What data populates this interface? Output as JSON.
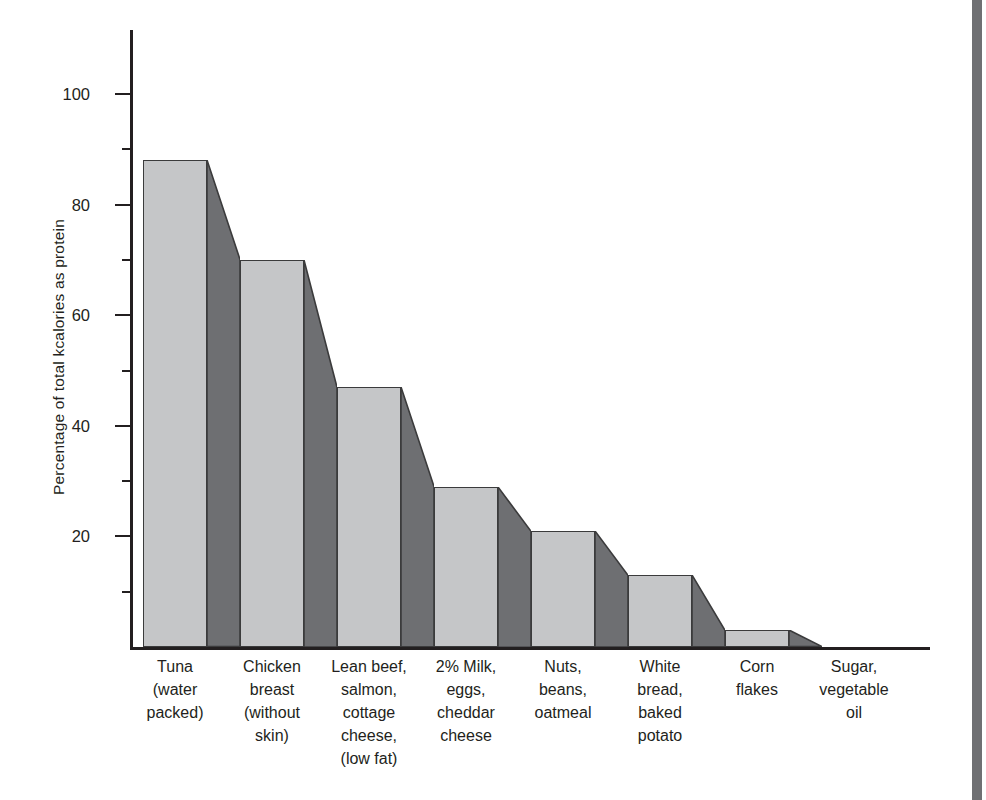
{
  "chart_data": {
    "type": "bar",
    "title": "",
    "xlabel": "",
    "ylabel": "Percentage of total kcalories as protein",
    "ylim": [
      0,
      110
    ],
    "grid": false,
    "legend": "none",
    "y_ticks_major": [
      20,
      40,
      60,
      80,
      100
    ],
    "y_tick_labels": [
      "20",
      "40",
      "60",
      "80",
      "100"
    ],
    "y_ticks_minor": [
      10,
      30,
      50,
      70,
      90
    ],
    "categories": [
      "Tuna (water packed)",
      "Chicken breast (without skin)",
      "Lean beef, salmon, cottage cheese, (low fat)",
      "2% Milk, eggs, cheddar cheese",
      "Nuts, beans, oatmeal",
      "White bread, baked potato",
      "Corn flakes",
      "Sugar, vegetable oil"
    ],
    "category_lines": [
      [
        "Tuna",
        "(water",
        "packed)"
      ],
      [
        "Chicken",
        "breast",
        "(without",
        "skin)"
      ],
      [
        "Lean beef,",
        "salmon,",
        "cottage",
        "cheese,",
        "(low fat)"
      ],
      [
        "2% Milk,",
        "eggs,",
        "cheddar",
        "cheese"
      ],
      [
        "Nuts,",
        "beans,",
        "oatmeal"
      ],
      [
        "White",
        "bread,",
        "baked",
        "potato"
      ],
      [
        "Corn",
        "flakes"
      ],
      [
        "Sugar,",
        "vegetable",
        "oil"
      ]
    ],
    "values": [
      88,
      70,
      47,
      29,
      21,
      13,
      3,
      0
    ],
    "colors": {
      "bar_front": "#c5c6c8",
      "bar_side": "#6e6f72",
      "outline": "#3b3b3c",
      "axis": "#231f20",
      "text": "#231f20",
      "background": "#ffffff",
      "page_edge_strip": "#6f7073"
    }
  }
}
